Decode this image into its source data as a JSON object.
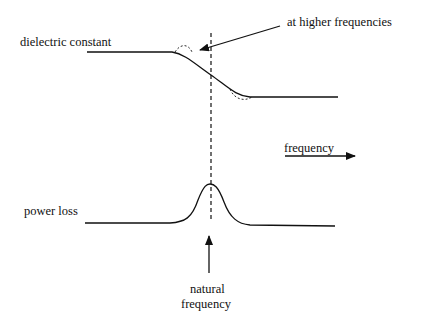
{
  "diagram": {
    "labels": {
      "dielectric_constant": "dielectric constant",
      "higher_freq": "at higher frequencies",
      "frequency": "frequency",
      "power_loss": "power loss",
      "natural_1": "natural",
      "natural_2": "frequency"
    },
    "colors": {
      "stroke": "#111111",
      "background": "#ffffff"
    }
  }
}
